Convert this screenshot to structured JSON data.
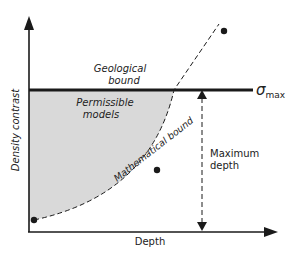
{
  "diagram": {
    "axes": {
      "x_label": "Depth",
      "y_label": "Density contrast"
    },
    "regions": {
      "geological_bound_line1": "Geological",
      "geological_bound_line2": "bound",
      "permissible_line1": "Permissible",
      "permissible_line2": "models"
    },
    "curve_label": "Mathematical bound",
    "sigma_symbol": "σ",
    "sigma_subscript": "max",
    "max_depth_line1": "Maximum",
    "max_depth_line2": "depth",
    "colors": {
      "region_fill": "#d9d9d9",
      "line": "#1a1a1a",
      "text": "#222222"
    }
  }
}
